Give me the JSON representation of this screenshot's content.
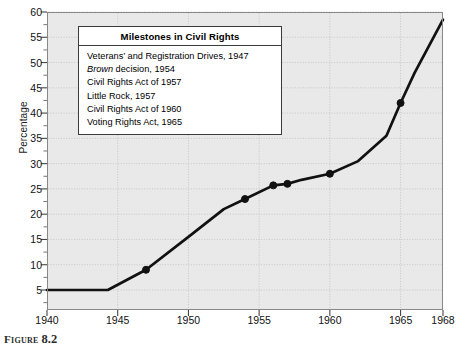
{
  "figure": {
    "caption_label": "Figure",
    "caption_number": "8.2"
  },
  "axes": {
    "y_axis_title": "Percentage",
    "y_ticks": [
      5,
      10,
      15,
      20,
      25,
      30,
      35,
      40,
      45,
      50,
      55,
      60
    ],
    "x_ticks": [
      1940,
      1945,
      1950,
      1955,
      1960,
      1965,
      1968
    ]
  },
  "legend_box": {
    "title": "Milestones in Civil Rights",
    "items": [
      {
        "text": "Veterans’ and Registration Drives, 1947",
        "italic_prefix": ""
      },
      {
        "text": " decision, 1954",
        "italic_prefix": "Brown"
      },
      {
        "text": "Civil Rights Act of 1957",
        "italic_prefix": ""
      },
      {
        "text": "Little Rock, 1957",
        "italic_prefix": ""
      },
      {
        "text": "Civil Rights Act of 1960",
        "italic_prefix": ""
      },
      {
        "text": "Voting Rights Act, 1965",
        "italic_prefix": ""
      }
    ]
  },
  "colors": {
    "plot_background": "#e9e9e9",
    "line": "#111111",
    "grid": "#b9b9b9",
    "frame": "#888888",
    "box_border": "#3b3b3b",
    "page_background": "#ffffff"
  },
  "chart_data": {
    "type": "line",
    "title": "Milestones in Civil Rights",
    "xlabel": "",
    "ylabel": "Percentage",
    "xlim": [
      1940,
      1968
    ],
    "ylim": [
      0,
      60
    ],
    "grid": true,
    "legend_position": "inside-top-left",
    "series": [
      {
        "name": "Percentage of Southern black voting-age population registered to vote",
        "x": [
          1940,
          1944.3,
          1947,
          1950,
          1952.5,
          1954,
          1956,
          1957,
          1958,
          1960,
          1962,
          1964,
          1965,
          1966,
          1968
        ],
        "y": [
          5,
          5,
          9,
          15.5,
          21,
          23,
          25.7,
          26,
          26.8,
          28,
          30.5,
          35.5,
          42,
          48,
          58.5
        ]
      }
    ],
    "markers": [
      {
        "x": 1947,
        "y": 9,
        "label": "Veterans’ and Registration Drives, 1947"
      },
      {
        "x": 1954,
        "y": 23,
        "label": "Brown decision, 1954"
      },
      {
        "x": 1956,
        "y": 25.7,
        "label": "Civil Rights Act of 1957"
      },
      {
        "x": 1957,
        "y": 26,
        "label": "Little Rock, 1957"
      },
      {
        "x": 1960,
        "y": 28,
        "label": "Civil Rights Act of 1960"
      },
      {
        "x": 1965,
        "y": 42,
        "label": "Voting Rights Act, 1965"
      }
    ]
  }
}
